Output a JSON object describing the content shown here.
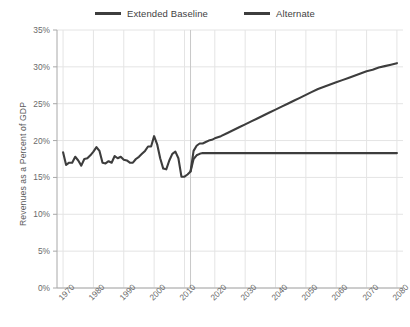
{
  "chart_data": {
    "type": "line",
    "title": "",
    "xlabel": "",
    "ylabel": "Revenues as a Percent of GDP",
    "xlim": [
      1968,
      2082
    ],
    "ylim": [
      0,
      35
    ],
    "grid": true,
    "legend_position": "top-center",
    "y_ticks": [
      "0%",
      "5%",
      "10%",
      "15%",
      "20%",
      "25%",
      "30%",
      "35%"
    ],
    "y_tick_values": [
      0,
      5,
      10,
      15,
      20,
      25,
      30,
      35
    ],
    "x_ticks": [
      "1970",
      "1980",
      "1990",
      "2000",
      "2010",
      "2020",
      "2030",
      "2040",
      "2050",
      "2060",
      "2070",
      "2080"
    ],
    "x_tick_values": [
      1970,
      1980,
      1990,
      2000,
      2010,
      2020,
      2030,
      2040,
      2050,
      2060,
      2070,
      2080
    ],
    "projection_divider_year": 2012,
    "annotations": [],
    "series": [
      {
        "name": "Extended Baseline",
        "color": "#3d3d3d",
        "x": [
          1970,
          1971,
          1972,
          1973,
          1974,
          1975,
          1976,
          1977,
          1978,
          1979,
          1980,
          1981,
          1982,
          1983,
          1984,
          1985,
          1986,
          1987,
          1988,
          1989,
          1990,
          1991,
          1992,
          1993,
          1994,
          1995,
          1996,
          1997,
          1998,
          1999,
          2000,
          2001,
          2002,
          2003,
          2004,
          2005,
          2006,
          2007,
          2008,
          2009,
          2010,
          2011,
          2012,
          2013,
          2014,
          2015,
          2016,
          2017,
          2018,
          2019,
          2020,
          2022,
          2024,
          2026,
          2028,
          2030,
          2032,
          2034,
          2036,
          2038,
          2040,
          2042,
          2044,
          2046,
          2048,
          2050,
          2052,
          2054,
          2056,
          2058,
          2060,
          2062,
          2064,
          2066,
          2068,
          2070,
          2072,
          2074,
          2076,
          2078,
          2080
        ],
        "values": [
          18.4,
          16.7,
          17.0,
          17.0,
          17.8,
          17.3,
          16.6,
          17.5,
          17.6,
          18.0,
          18.5,
          19.1,
          18.6,
          17.0,
          16.9,
          17.2,
          17.0,
          17.9,
          17.6,
          17.8,
          17.4,
          17.3,
          17.0,
          17.0,
          17.5,
          17.8,
          18.2,
          18.6,
          19.2,
          19.2,
          20.6,
          19.5,
          17.6,
          16.2,
          16.1,
          17.3,
          18.2,
          18.5,
          17.6,
          15.1,
          15.1,
          15.4,
          15.8,
          18.6,
          19.3,
          19.6,
          19.6,
          19.8,
          20.0,
          20.1,
          20.3,
          20.6,
          21.0,
          21.4,
          21.8,
          22.2,
          22.6,
          23.0,
          23.4,
          23.8,
          24.2,
          24.6,
          25.0,
          25.4,
          25.8,
          26.2,
          26.6,
          27.0,
          27.3,
          27.6,
          27.9,
          28.2,
          28.5,
          28.8,
          29.1,
          29.4,
          29.6,
          29.9,
          30.1,
          30.3,
          30.5
        ]
      },
      {
        "name": "Alternate",
        "color": "#3d3d3d",
        "x": [
          2012,
          2013,
          2014,
          2015,
          2016,
          2017,
          2018,
          2020,
          2025,
          2030,
          2035,
          2040,
          2045,
          2050,
          2055,
          2060,
          2065,
          2070,
          2075,
          2080
        ],
        "values": [
          15.8,
          17.5,
          18.0,
          18.2,
          18.3,
          18.3,
          18.3,
          18.3,
          18.3,
          18.3,
          18.3,
          18.3,
          18.3,
          18.3,
          18.3,
          18.3,
          18.3,
          18.3,
          18.3,
          18.3
        ]
      }
    ]
  },
  "legend": {
    "items": [
      {
        "label": "Extended Baseline",
        "color": "#3d3d3d"
      },
      {
        "label": "Alternate",
        "color": "#3d3d3d"
      }
    ]
  },
  "colors": {
    "line": "#3d3d3d",
    "axis": "#a8a8a8",
    "grid": "#e4e4e4",
    "divider": "#c8c8c8",
    "tick_text": "#6a6a6a"
  }
}
